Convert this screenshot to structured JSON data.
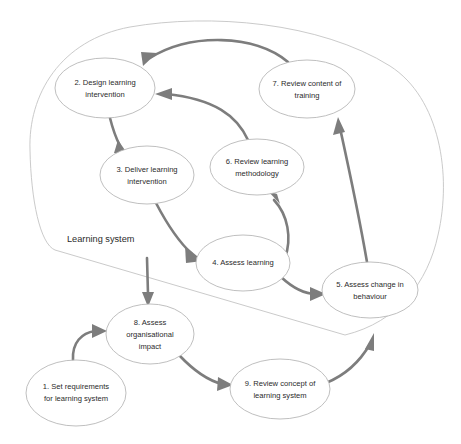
{
  "diagram": {
    "boundary_label": "Learning system",
    "colors": {
      "background": "#ffffff",
      "node_stroke": "#b8b8b8",
      "boundary_stroke": "#c4c4c4",
      "arrow": "#7d7d7d",
      "text": "#2b2b2b"
    },
    "nodes": [
      {
        "id": "node-1",
        "number": "1",
        "lines": [
          "1. Set requirements",
          "for learning system"
        ],
        "cx": 76,
        "cy": 393,
        "rx": 50,
        "ry": 33,
        "inside_boundary": false
      },
      {
        "id": "node-2",
        "number": "2",
        "lines": [
          "2. Design learning",
          "intervention"
        ],
        "cx": 105,
        "cy": 88,
        "rx": 50,
        "ry": 30,
        "inside_boundary": true
      },
      {
        "id": "node-3",
        "number": "3",
        "lines": [
          "3. Deliver learning",
          "intervention"
        ],
        "cx": 147,
        "cy": 175,
        "rx": 47,
        "ry": 29,
        "inside_boundary": true
      },
      {
        "id": "node-4",
        "number": "4",
        "lines": [
          "4. Assess learning"
        ],
        "cx": 243,
        "cy": 263,
        "rx": 47,
        "ry": 28,
        "inside_boundary": true
      },
      {
        "id": "node-5",
        "number": "5",
        "lines": [
          "5. Assess change in",
          "behaviour"
        ],
        "cx": 370,
        "cy": 290,
        "rx": 48,
        "ry": 28,
        "inside_boundary": true
      },
      {
        "id": "node-6",
        "number": "6",
        "lines": [
          "6. Review learning",
          "methodology"
        ],
        "cx": 257,
        "cy": 167,
        "rx": 47,
        "ry": 28,
        "inside_boundary": true
      },
      {
        "id": "node-7",
        "number": "7",
        "lines": [
          "7. Review content of",
          "training"
        ],
        "cx": 307,
        "cy": 89,
        "rx": 48,
        "ry": 29,
        "inside_boundary": true
      },
      {
        "id": "node-8",
        "number": "8",
        "lines": [
          "8. Assess",
          "organisational",
          "impact"
        ],
        "cx": 150,
        "cy": 334,
        "rx": 44,
        "ry": 30,
        "inside_boundary": false
      },
      {
        "id": "node-9",
        "number": "9",
        "lines": [
          "9. Review concept of",
          "learning system"
        ],
        "cx": 280,
        "cy": 389,
        "rx": 50,
        "ry": 30,
        "inside_boundary": false
      }
    ],
    "edges": [
      {
        "id": "edge-2-3",
        "from": "node-2",
        "to": "node-3",
        "label": ""
      },
      {
        "id": "edge-3-4",
        "from": "node-3",
        "to": "node-4",
        "label": ""
      },
      {
        "id": "edge-4-5",
        "from": "node-4",
        "to": "node-5",
        "label": ""
      },
      {
        "id": "edge-4-6",
        "from": "node-4",
        "to": "node-6",
        "label": ""
      },
      {
        "id": "edge-6-2",
        "from": "node-6",
        "to": "node-2",
        "label": ""
      },
      {
        "id": "edge-7-2",
        "from": "node-7",
        "to": "node-2",
        "label": ""
      },
      {
        "id": "edge-5-7",
        "from": "node-5",
        "to": "node-7",
        "label": ""
      },
      {
        "id": "edge-3-8",
        "from": "node-3",
        "to": "node-8",
        "label": ""
      },
      {
        "id": "edge-1-8",
        "from": "node-1",
        "to": "node-8",
        "label": ""
      },
      {
        "id": "edge-8-9",
        "from": "node-8",
        "to": "node-9",
        "label": ""
      },
      {
        "id": "edge-9-5",
        "from": "node-9",
        "to": "node-5",
        "label": ""
      }
    ]
  }
}
